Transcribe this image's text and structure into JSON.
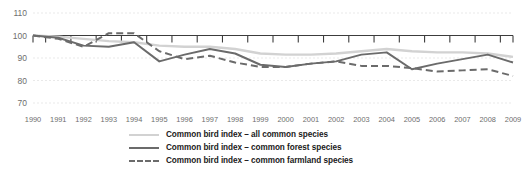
{
  "chart_data": {
    "type": "line",
    "title": "",
    "subtitle": "",
    "xlabel": "",
    "ylabel": "",
    "x": [
      1990,
      1991,
      1992,
      1993,
      1994,
      1995,
      1996,
      1997,
      1998,
      1999,
      2000,
      2001,
      2002,
      2003,
      2004,
      2005,
      2006,
      2007,
      2008,
      2009
    ],
    "categories": [
      "1990",
      "1991",
      "1992",
      "1993",
      "1994",
      "1995",
      "1996",
      "1997",
      "1998",
      "1999",
      "2000",
      "2001",
      "2002",
      "2003",
      "2004",
      "2005",
      "2006",
      "2007",
      "2008",
      "2009"
    ],
    "xlim": [
      1990,
      2009
    ],
    "ylim": [
      70,
      110
    ],
    "yticks": [
      70,
      80,
      90,
      100,
      110
    ],
    "ytick_labels": [
      "70",
      "80",
      "90",
      "100",
      "110"
    ],
    "grid": true,
    "grid_axis": "y",
    "legend_position": "bottom",
    "series": [
      {
        "name": "Common bird index – all common species",
        "style": "solid",
        "color": "#d2d2d2",
        "values": [
          100,
          99.5,
          98.5,
          97.5,
          97,
          95.5,
          95,
          95,
          94,
          92,
          91.5,
          91.5,
          92,
          93,
          94,
          93,
          92.5,
          92.5,
          92,
          90.5
        ]
      },
      {
        "name": "Common bird index – common forest species",
        "style": "solid",
        "color": "#6b6b6b",
        "values": [
          100,
          99,
          95.5,
          95,
          97,
          88.5,
          91.5,
          94,
          92,
          87,
          86,
          87.5,
          88.5,
          91.5,
          92.5,
          85,
          87.5,
          89.5,
          91.5,
          88
        ]
      },
      {
        "name": "Common bird index – common farmland species",
        "style": "dashed",
        "color": "#6b6b6b",
        "values": [
          100,
          98.5,
          95,
          101,
          101,
          93,
          89.5,
          91,
          88,
          86,
          86,
          87.5,
          88.5,
          86.5,
          86.5,
          85.5,
          84,
          84.5,
          85,
          82
        ]
      }
    ]
  },
  "legend": {
    "items": [
      {
        "label": "Common bird index – all common species",
        "icon": "line-solid-light-icon"
      },
      {
        "label": "Common bird index – common forest species",
        "icon": "line-solid-dark-icon"
      },
      {
        "label": "Common bird index – common farmland species",
        "icon": "line-dashed-dark-icon"
      }
    ]
  },
  "colors": {
    "all_common_species": "#d2d2d2",
    "forest_species": "#6b6b6b",
    "farmland_species": "#6b6b6b",
    "axis": "#3c3c3c",
    "grid": "#e3e3e3",
    "tick_label": "#6e6e6e",
    "legend_text": "#1a1a1a",
    "background": "#ffffff"
  }
}
